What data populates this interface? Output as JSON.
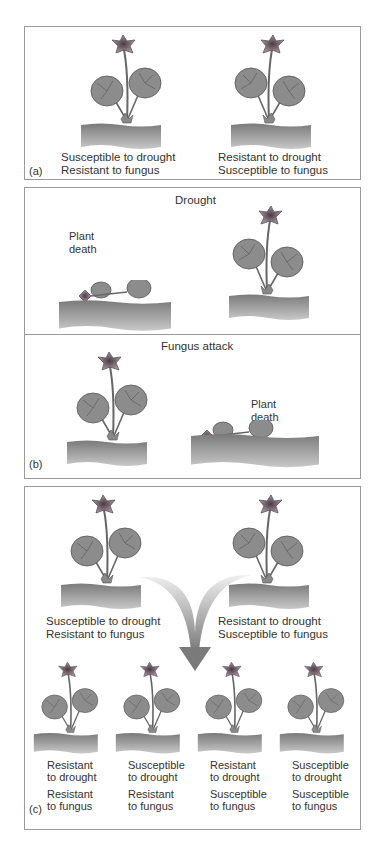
{
  "colors": {
    "border": "#9a9a9a",
    "leaf": "#8c8c8c",
    "leaf_edge": "#555555",
    "soil": "#9a9a9a",
    "flower": "#8a7a84",
    "arrow": "#8a8a8a"
  },
  "panel_a": {
    "label": "(a)",
    "plants": [
      {
        "line1": "Susceptible to drought",
        "line2": "Resistant to fungus"
      },
      {
        "line1": "Resistant to drought",
        "line2": "Susceptible to fungus"
      }
    ]
  },
  "panel_b": {
    "label": "(b)",
    "drought": {
      "title": "Drought",
      "death_line1": "Plant",
      "death_line2": "death"
    },
    "fungus": {
      "title": "Fungus attack",
      "death_line1": "Plant",
      "death_line2": "death"
    }
  },
  "panel_c": {
    "label": "(c)",
    "parents": [
      {
        "line1": "Susceptible to drought",
        "line2": "Resistant to fungus"
      },
      {
        "line1": "Resistant to drought",
        "line2": "Susceptible to fungus"
      }
    ],
    "offspring": [
      {
        "d1": "Resistant",
        "d2": "to drought",
        "f1": "Resistant",
        "f2": "to fungus"
      },
      {
        "d1": "Susceptible",
        "d2": "to drought",
        "f1": "Resistant",
        "f2": "to fungus"
      },
      {
        "d1": "Resistant",
        "d2": "to drought",
        "f1": "Susceptible",
        "f2": "to fungus"
      },
      {
        "d1": "Susceptible",
        "d2": "to drought",
        "f1": "Susceptible",
        "f2": "to fungus"
      }
    ]
  }
}
